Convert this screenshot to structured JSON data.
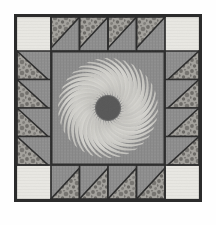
{
  "image": {
    "subject": "patchwork quilt block photograph",
    "background_color": "#fefefe",
    "width": 216,
    "height": 225
  },
  "quilt_block": {
    "name": "sunburst medallion quilt block",
    "outer_frame": {
      "color": "#2b2b2b",
      "thickness_px": 3,
      "left": 14,
      "top": 14,
      "width": 188,
      "height": 188
    },
    "fabrics": {
      "background_solid": "#8d8d8d",
      "medium_gray": "#8a8a8a",
      "light_cream": "#e9e8e3",
      "print_mottled_base": "#9c9a95",
      "print_mottled_speck": "#6f6d69",
      "center_field": "#8b8b8b",
      "petal_light": "#d9d8d3",
      "hub_dark": "#575757",
      "seam_line": "#2b2b2b"
    },
    "corner_squares": {
      "count": 4,
      "fabric": "light_cream",
      "label": "corner-square",
      "size_px": 34,
      "positions": [
        "top-left",
        "top-right",
        "bottom-left",
        "bottom-right"
      ]
    },
    "borders": [
      {
        "edge": "top",
        "unit_type": "half-square-triangle",
        "unit_count": 4,
        "triangle_fabric": "print_mottled",
        "ground_fabric": "medium_gray",
        "triangle_orientation": "point-down-left"
      },
      {
        "edge": "bottom",
        "unit_type": "half-square-triangle",
        "unit_count": 4,
        "triangle_fabric": "print_mottled",
        "ground_fabric": "medium_gray",
        "triangle_orientation": "point-up-left"
      },
      {
        "edge": "left",
        "unit_type": "half-square-triangle",
        "unit_count": 4,
        "triangle_fabric": "print_mottled",
        "ground_fabric": "medium_gray",
        "triangle_orientation": "point-right-up"
      },
      {
        "edge": "right",
        "unit_type": "half-square-triangle",
        "unit_count": 4,
        "triangle_fabric": "print_mottled",
        "ground_fabric": "medium_gray",
        "triangle_orientation": "point-left-up"
      }
    ],
    "center_panel": {
      "label": "center-panel",
      "fabric": "center_field",
      "inset_px": 35,
      "size_px": 118,
      "border_color": "#2b2b2b"
    },
    "medallion": {
      "label": "sunburst-medallion",
      "motif": "spiral radiating petals",
      "petal_count": 34,
      "petal_fabric": "petal_light",
      "rotation_direction": "counter-clockwise",
      "inner_radius_px": 13,
      "outer_radius_px": 50,
      "hub": {
        "label": "medallion-hub",
        "fabric": "hub_dark",
        "radius_px": 12
      }
    }
  }
}
